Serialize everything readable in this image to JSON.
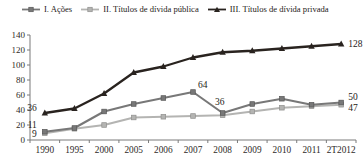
{
  "chart_data": {
    "type": "line",
    "categories": [
      "1990",
      "1995",
      "2000",
      "2005",
      "2006",
      "2007",
      "2008",
      "2009",
      "2010",
      "2011",
      "2T2012"
    ],
    "series": [
      {
        "name": "I. Ações",
        "marker": "square",
        "color": "#787878",
        "marker_stroke": "#565656",
        "values": [
          11,
          16,
          38,
          48,
          56,
          64,
          36,
          48,
          55,
          47,
          50
        ]
      },
      {
        "name": "II. Títulos de dívida pública",
        "marker": "square",
        "color": "#b4b4b2",
        "marker_stroke": "#8f8f8d",
        "values": [
          9,
          15,
          20,
          30,
          31,
          32,
          33,
          38,
          43,
          45,
          47
        ]
      },
      {
        "name": "III. Títulos de dívida privada",
        "marker": "triangle",
        "color": "#29231f",
        "marker_stroke": "#29231f",
        "values": [
          36,
          42,
          62,
          90,
          98,
          110,
          117,
          119,
          122,
          125,
          128
        ]
      }
    ],
    "ylim": [
      0,
      140
    ],
    "ytick_step": 20,
    "yticks": [
      0,
      20,
      40,
      60,
      80,
      100,
      120,
      140
    ],
    "grid": false,
    "legend_position": "top",
    "annotations": [
      {
        "series": 2,
        "index": 0,
        "text": "36",
        "dx": -8,
        "dy": -2,
        "anchor": "end"
      },
      {
        "series": 0,
        "index": 0,
        "text": "11",
        "dx": -8,
        "dy": -4,
        "anchor": "end"
      },
      {
        "series": 1,
        "index": 0,
        "text": "9",
        "dx": -8,
        "dy": 4,
        "anchor": "end"
      },
      {
        "series": 0,
        "index": 5,
        "text": "64",
        "dx": 5,
        "dy": -4,
        "anchor": "start"
      },
      {
        "series": 0,
        "index": 6,
        "text": "36",
        "dx": -3,
        "dy": -8,
        "anchor": "middle"
      },
      {
        "series": 2,
        "index": 10,
        "text": "128",
        "dx": 7,
        "dy": 3,
        "anchor": "start"
      },
      {
        "series": 0,
        "index": 10,
        "text": "50",
        "dx": 7,
        "dy": -3,
        "anchor": "start"
      },
      {
        "series": 1,
        "index": 10,
        "text": "47",
        "dx": 7,
        "dy": 6,
        "anchor": "start"
      }
    ],
    "axis_color": "#7a7a7a"
  }
}
